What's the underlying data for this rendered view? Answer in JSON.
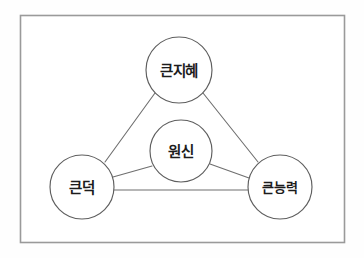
{
  "figure": {
    "kind": "concept-relationship-diagram",
    "frame": {
      "border_color": "#9a9a9a",
      "background_color": "#ffffff"
    },
    "palette": {
      "node_stroke": "#5e5e5e",
      "node_fill": "#ffffff",
      "edge_stroke": "#6f6f6f",
      "text_color": "#1c1c1c"
    }
  },
  "nodes": [
    {
      "id": "top",
      "label": "큰지혜",
      "cx": 179,
      "cy": 70,
      "r": 33,
      "role": "apex-node"
    },
    {
      "id": "center",
      "label": "원신",
      "cx": 181,
      "cy": 151,
      "r": 31,
      "role": "center-node"
    },
    {
      "id": "left",
      "label": "큰덕",
      "cx": 82,
      "cy": 187,
      "r": 32,
      "role": "left-node"
    },
    {
      "id": "right",
      "label": "큰능력",
      "cx": 280,
      "cy": 187,
      "r": 32,
      "role": "right-node"
    }
  ],
  "edges": [
    {
      "id": "top-left",
      "from": "top",
      "to": "left",
      "x1": 155,
      "y1": 93,
      "x2": 105,
      "y2": 162
    },
    {
      "id": "top-right",
      "from": "top",
      "to": "right",
      "x1": 203,
      "y1": 93,
      "x2": 258,
      "y2": 162
    },
    {
      "id": "left-right",
      "from": "left",
      "to": "right",
      "x1": 114,
      "y1": 190,
      "x2": 248,
      "y2": 190
    },
    {
      "id": "left-center",
      "from": "left",
      "to": "center",
      "x1": 113,
      "y1": 177,
      "x2": 152,
      "y2": 166
    },
    {
      "id": "center-right",
      "from": "center",
      "to": "right",
      "x1": 210,
      "y1": 164,
      "x2": 249,
      "y2": 178
    }
  ]
}
